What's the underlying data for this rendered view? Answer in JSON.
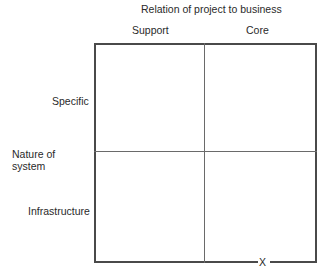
{
  "diagram": {
    "top_axis_title": "Relation of project to business",
    "columns": [
      "Support",
      "Core"
    ],
    "left_axis_title": [
      "Nature of",
      "system"
    ],
    "rows": [
      "Specific",
      "Infrastructure"
    ],
    "marker": "X"
  }
}
